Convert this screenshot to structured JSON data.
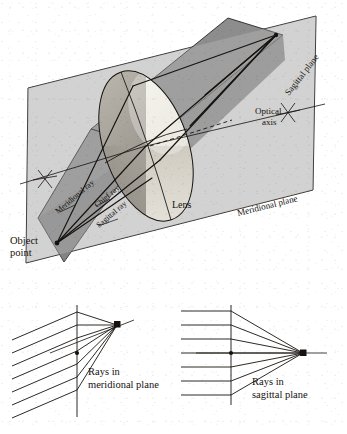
{
  "figure": {
    "title_visible": false,
    "background_color": "#ffffff",
    "ink_color": "#15120f"
  },
  "colors": {
    "meridional_plane_fill": "#d6d6d6",
    "sagittal_plane_fill": "#8d8d8d",
    "sagittal_plane_fill_dark": "#6f6f6f",
    "lens_light": "#efece4",
    "lens_mid": "#b8b4aa",
    "lens_dark": "#8d8a82",
    "lens_darkest": "#5e5c58",
    "outline": "#15120f"
  },
  "main_diagram": {
    "labels": {
      "object_point": "Object\npoint",
      "object_point_line1": "Object",
      "object_point_line2": "point",
      "meridional_ray": "Meridional ray",
      "chief_ray": "Chief ray",
      "sagittal_ray": "Sagittal ray",
      "lens": "Lens",
      "optical_axis_line1": "Optical",
      "optical_axis_line2": "axis",
      "meridional_plane": "Meridional plane",
      "sagittal_plane": "Sagittal plane"
    },
    "geometry": {
      "object_point": [
        57,
        243
      ],
      "image_point": [
        276,
        35
      ],
      "lens_center": [
        146,
        146
      ],
      "axis_left_mark": [
        45,
        178
      ],
      "axis_right_mark": [
        288,
        113
      ]
    }
  },
  "bottom_panels": [
    {
      "id": "meridional-panel",
      "label_line1": "Rays in",
      "label_line2": "meridional plane",
      "ray_count": 7,
      "focus_point": [
        117,
        325
      ],
      "axis_point": [
        77,
        353
      ],
      "plane_line_x": 77
    },
    {
      "id": "sagittal-panel",
      "label_line1": "Rays in",
      "label_line2": "sagittal plane",
      "ray_count": 7,
      "focus_point": [
        303,
        353
      ],
      "axis_point": [
        231,
        353
      ],
      "plane_line_x": 231
    }
  ]
}
